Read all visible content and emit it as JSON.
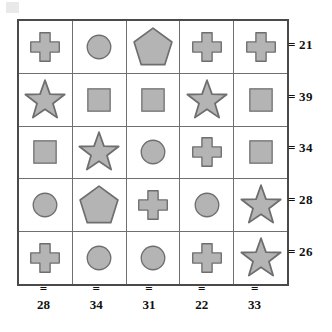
{
  "puzzle": {
    "title": "shape-sum-grid",
    "grid": {
      "rows": 5,
      "cols": 5,
      "cells": [
        [
          "cross",
          "circle",
          "pentagon",
          "cross",
          "cross"
        ],
        [
          "star",
          "square",
          "square",
          "star",
          "square"
        ],
        [
          "square",
          "star",
          "circle",
          "cross",
          "square"
        ],
        [
          "circle",
          "pentagon",
          "cross",
          "circle",
          "star"
        ],
        [
          "cross",
          "circle",
          "circle",
          "cross",
          "star"
        ]
      ]
    },
    "row_sums": [
      {
        "eq": "=",
        "value": "21"
      },
      {
        "eq": "=",
        "value": "39"
      },
      {
        "eq": "=",
        "value": "34"
      },
      {
        "eq": "=",
        "value": "28"
      },
      {
        "eq": "=",
        "value": "26"
      }
    ],
    "col_sums": [
      {
        "eq": "=",
        "value": "28"
      },
      {
        "eq": "=",
        "value": "34"
      },
      {
        "eq": "=",
        "value": "31"
      },
      {
        "eq": "=",
        "value": "22"
      },
      {
        "eq": "=",
        "value": "33"
      }
    ],
    "colors": {
      "shape_fill": "#b4b4b4",
      "shape_stroke": "#6e6e6e",
      "grid_line": "#6f6f6f",
      "grid_border": "#4a4a4a",
      "text": "#111111",
      "page_background": "#ffffff"
    },
    "shape_names": {
      "cross": "cross-shape",
      "circle": "circle-shape",
      "square": "square-shape",
      "star": "star-shape",
      "pentagon": "pentagon-shape"
    }
  }
}
